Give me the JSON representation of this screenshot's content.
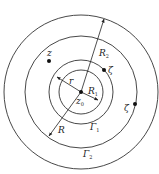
{
  "diagram": {
    "type": "concentric-circles",
    "center": {
      "x": 81,
      "y": 92
    },
    "stroke_color": "#333333",
    "circles": [
      {
        "name": "outer-circle",
        "radius": 77
      },
      {
        "name": "gamma2-circle",
        "radius": 56
      },
      {
        "name": "gamma1-circle",
        "radius": 32
      },
      {
        "name": "inner-circle",
        "radius": 22
      }
    ],
    "labels": {
      "z": {
        "text": "z",
        "x": 47,
        "y": 56
      },
      "zeta_inner": {
        "text": "ζ",
        "x": 108,
        "y": 72
      },
      "zeta_outer": {
        "text": "ζ",
        "x": 125,
        "y": 111
      },
      "R2": {
        "text": "R",
        "sub": "2",
        "x": 100,
        "y": 56
      },
      "r": {
        "text": "r",
        "x": 69,
        "y": 85
      },
      "R1": {
        "text": "R",
        "sub": "1",
        "x": 88,
        "y": 95
      },
      "z0": {
        "text": "z",
        "sub": "0",
        "x": 77,
        "y": 105
      },
      "R": {
        "text": "R",
        "x": 58,
        "y": 133
      },
      "Gamma1": {
        "text": "Γ",
        "sub": "1",
        "x": 91,
        "y": 130
      },
      "Gamma2": {
        "text": "Γ",
        "sub": "2",
        "x": 84,
        "y": 158
      }
    },
    "points": [
      {
        "name": "point-z",
        "x": 49,
        "y": 61
      },
      {
        "name": "point-zeta-inner",
        "x": 104,
        "y": 70
      },
      {
        "name": "point-zeta-outer",
        "x": 135,
        "y": 104
      },
      {
        "name": "point-z0",
        "x": 81,
        "y": 92
      }
    ]
  }
}
